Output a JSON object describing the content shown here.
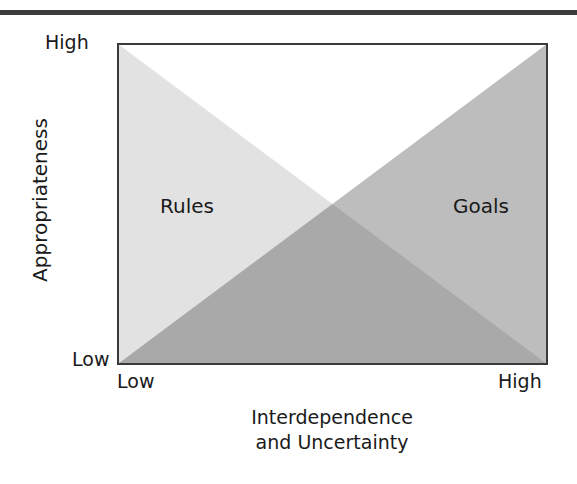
{
  "figure": {
    "y_axis": {
      "title": "Appropriateness",
      "tick_high": "High",
      "tick_low": "Low"
    },
    "x_axis": {
      "title_line1": "Interdependence",
      "title_line2": "and Uncertainty",
      "tick_low": "Low",
      "tick_high": "High"
    },
    "regions": {
      "rules": {
        "label": "Rules",
        "description": "Appropriateness decreases from High to Low as interdependence and uncertainty increase",
        "fill": "#e2e2e2"
      },
      "goals": {
        "label": "Goals",
        "description": "Appropriateness increases from Low to High as interdependence and uncertainty increase",
        "fill": "#bdbdbd"
      },
      "overlap_fill": "#a9a9a9"
    },
    "colors": {
      "frame": "#3a3a3a",
      "top_rule": "#3c3c3c",
      "background": "#ffffff"
    }
  }
}
